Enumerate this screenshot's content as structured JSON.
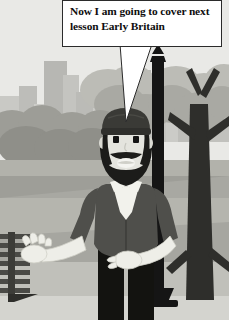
{
  "scene": {
    "title": "Cartoon history lesson scene",
    "description": "Bearded cartoon narrator standing in a city park beside a lamp post with a speech bubble",
    "width": 229,
    "height": 320
  },
  "speech_bubble": {
    "name": "speech-bubble",
    "text": "Now I am going to cover next lesson Early Britain",
    "line_1": "Now I am going to cover next",
    "line_2": "lesson Early Britain",
    "fill": "#ffffff",
    "border": "#2b2b2b",
    "text_color": "#0e0e0e",
    "tail_target": "character-head"
  },
  "background": {
    "sky": "#e9e9e6",
    "skyline": {
      "name": "city-skyline",
      "buildings": [
        {
          "x": 0,
          "y": 96,
          "w": 22,
          "h": 44,
          "fill": "#c9c9c5"
        },
        {
          "x": 19,
          "y": 86,
          "w": 18,
          "h": 54,
          "fill": "#bdbdb9"
        },
        {
          "x": 34,
          "y": 104,
          "w": 14,
          "h": 36,
          "fill": "#cdcdc9"
        },
        {
          "x": 44,
          "y": 61,
          "w": 23,
          "h": 79,
          "fill": "#b7b7b3"
        },
        {
          "x": 63,
          "y": 75,
          "w": 16,
          "h": 65,
          "fill": "#c4c4c0"
        },
        {
          "x": 76,
          "y": 92,
          "w": 20,
          "h": 48,
          "fill": "#bbbbb7"
        },
        {
          "x": 93,
          "y": 108,
          "w": 13,
          "h": 32,
          "fill": "#cacac6"
        },
        {
          "x": 104,
          "y": 84,
          "w": 19,
          "h": 56,
          "fill": "#c0c0bc"
        },
        {
          "x": 120,
          "y": 100,
          "w": 16,
          "h": 40,
          "fill": "#c8c8c4"
        },
        {
          "x": 134,
          "y": 70,
          "w": 17,
          "h": 70,
          "fill": "#b9b9b5"
        },
        {
          "x": 148,
          "y": 96,
          "w": 20,
          "h": 44,
          "fill": "#c5c5c1"
        },
        {
          "x": 166,
          "y": 110,
          "w": 14,
          "h": 30,
          "fill": "#cbcbc7"
        },
        {
          "x": 178,
          "y": 88,
          "w": 18,
          "h": 52,
          "fill": "#bebeba"
        },
        {
          "x": 195,
          "y": 102,
          "w": 19,
          "h": 38,
          "fill": "#c7c7c3"
        },
        {
          "x": 210,
          "y": 92,
          "w": 19,
          "h": 48,
          "fill": "#c1c1bd"
        }
      ]
    },
    "foliage": {
      "name": "tree-foliage",
      "light": "#bcbcb6",
      "mid": "#a9a9a3",
      "dark": "#8f8f89"
    },
    "ground": {
      "name": "park-ground",
      "grass_far": "#b2b2ab",
      "path": "#a0a09a",
      "grass_near": "#bdbdb6",
      "foreground": "#c6c6c0",
      "horizon_y": 163
    }
  },
  "lamp_post": {
    "name": "lamp-post",
    "color": "#151515",
    "post_x": 152,
    "post_top": 57,
    "post_bottom": 300,
    "base_y": 298
  },
  "tree": {
    "name": "park-tree",
    "trunk_color": "#2e2e2b",
    "trunk_x": 196
  },
  "bench": {
    "name": "park-bench",
    "color": "#4a4a46",
    "slat_count": 7,
    "x": 0,
    "y": 233
  },
  "character": {
    "name": "narrator-character",
    "hat": {
      "name": "beanie-hat",
      "color": "#3a3a36"
    },
    "hair": {
      "name": "hair",
      "color": "#232320"
    },
    "skin": {
      "name": "skin",
      "color": "#e4e4de"
    },
    "beard": {
      "name": "beard",
      "color": "#1c1c1a"
    },
    "eyes": {
      "name": "eyes",
      "color": "#141414"
    },
    "mouth": {
      "name": "mouth",
      "color": "#f4f4f0"
    },
    "vest": {
      "name": "vest",
      "color": "#4f4f4b"
    },
    "shirt": {
      "name": "shirt-sleeves",
      "color": "#eeeee8"
    },
    "cravat": {
      "name": "cravat-collar",
      "color": "#f2f2ec"
    },
    "trousers": {
      "name": "trousers",
      "color": "#131310"
    },
    "gesture": "open-palm-left-hand"
  }
}
